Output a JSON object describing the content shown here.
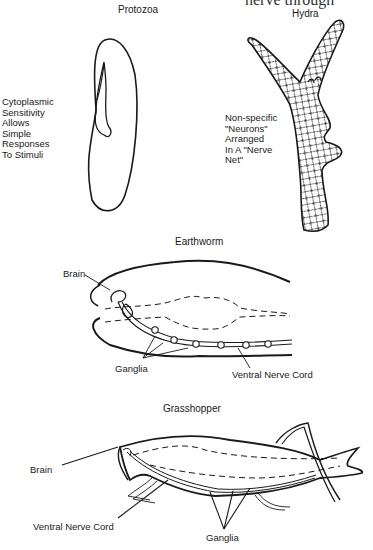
{
  "header_fragment": "nerve through",
  "panels": {
    "protozoa": {
      "title": "Protozoa",
      "caption": "Cytoplasmic\nSensitivity\nAllows\nSimple\nResponses\nTo Stimuli"
    },
    "hydra": {
      "title": "Hydra",
      "caption": "Non-specific\n\"Neurons\"\nArranged\nIn A \"Nerve\nNet\""
    },
    "earthworm": {
      "title": "Earthworm",
      "labels": {
        "brain": "Brain",
        "ganglia": "Ganglia",
        "ventral_nerve_cord": "Ventral Nerve Cord"
      }
    },
    "grasshopper": {
      "title": "Grasshopper",
      "labels": {
        "brain": "Brain",
        "ventral_nerve_cord": "Ventral Nerve Cord",
        "ganglia": "Ganglia"
      }
    }
  },
  "colors": {
    "ink": "#1a1a1a",
    "background": "#ffffff"
  }
}
